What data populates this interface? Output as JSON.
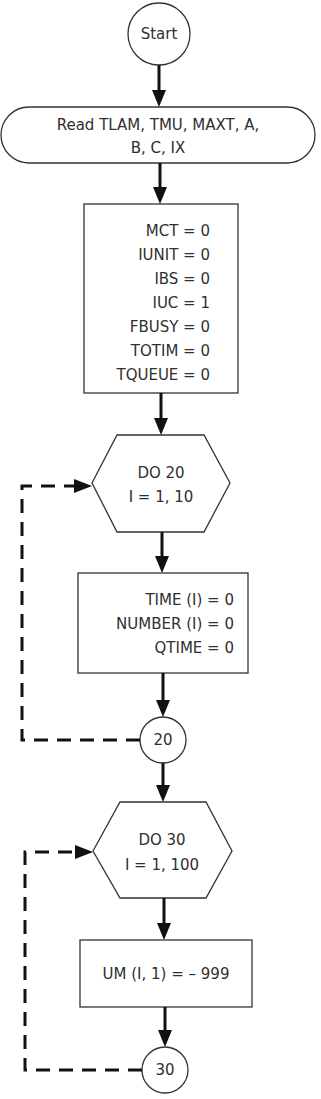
{
  "flowchart": {
    "start": {
      "label": "Start"
    },
    "read": {
      "line1": "Read TLAM, TMU, MAXT, A,",
      "line2": "B, C, IX"
    },
    "init_box": {
      "lines": [
        "MCT  =  0",
        "IUNIT  =  0",
        "IBS  =  0",
        "IUC  =  1",
        "FBUSY  =  0",
        "TOTIM  =  0",
        "TQUEUE  =  0"
      ]
    },
    "loop1": {
      "header": {
        "line1": "DO 20",
        "line2": "I = 1, 10"
      },
      "body": {
        "lines": [
          "TIME (I)  =  0",
          "NUMBER (I)  =  0",
          "QTIME  =  0"
        ]
      },
      "connector": {
        "label": "20"
      }
    },
    "loop2": {
      "header": {
        "line1": "DO 30",
        "line2": "I  =  1,  100"
      },
      "body": {
        "lines": [
          "UM (I,  1)  = –  999"
        ]
      },
      "connector": {
        "label": "30"
      }
    },
    "colors": {
      "line": "#111111",
      "shape_border": "#333333",
      "text": "#2f2f2f",
      "background": "#ffffff"
    }
  }
}
